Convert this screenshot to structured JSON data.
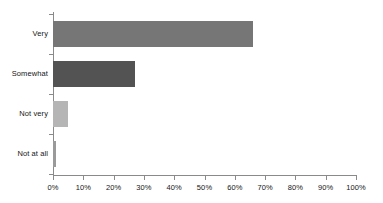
{
  "chart_data": {
    "type": "bar",
    "orientation": "horizontal",
    "title": "",
    "subtitle": "",
    "xlabel": "",
    "ylabel": "",
    "categories": [
      "Very",
      "Somewhat",
      "Not very",
      "Not at all"
    ],
    "values": [
      66,
      27,
      5,
      1
    ],
    "series": [
      {
        "name": "",
        "values": [
          66,
          27,
          5,
          1
        ]
      }
    ],
    "bar_colors": [
      "#767676",
      "#535353",
      "#b5b5b5",
      "#9a9a9a"
    ],
    "xlim": [
      0,
      100
    ],
    "xticks": [
      0,
      10,
      20,
      30,
      40,
      50,
      60,
      70,
      80,
      90,
      100
    ],
    "xticklabels": [
      "0%",
      "10%",
      "20%",
      "30%",
      "40%",
      "50%",
      "60%",
      "70%",
      "80%",
      "90%",
      "100%"
    ],
    "grid": false,
    "legend": false,
    "legend_position": "none",
    "axis_color": "#8a8a8a",
    "background": "#ffffff"
  }
}
